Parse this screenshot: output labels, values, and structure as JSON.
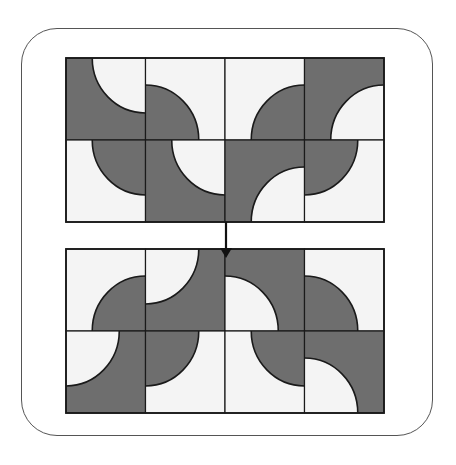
{
  "figure": {
    "colors": {
      "dark": "#6e6e6e",
      "light": "#f4f4f4",
      "line": "#1a1a1a",
      "frame": "#555555"
    },
    "radius_ratio": 0.67
  },
  "grids": [
    {
      "name": "top-grid",
      "x": 66,
      "y": 58,
      "w": 318,
      "h": 164,
      "tiles": [
        [
          {
            "base": "dark",
            "corner": "tr"
          },
          {
            "base": "light",
            "corner": "bl"
          },
          {
            "base": "light",
            "corner": "br"
          },
          {
            "base": "dark",
            "corner": "br"
          }
        ],
        [
          {
            "base": "light",
            "corner": "tr"
          },
          {
            "base": "dark",
            "corner": "tr"
          },
          {
            "base": "dark",
            "corner": "br"
          },
          {
            "base": "light",
            "corner": "tl"
          }
        ]
      ]
    },
    {
      "name": "bottom-grid",
      "x": 66,
      "y": 249,
      "w": 318,
      "h": 164,
      "tiles": [
        [
          {
            "base": "light",
            "corner": "br"
          },
          {
            "base": "dark",
            "corner": "tl"
          },
          {
            "base": "dark",
            "corner": "bl"
          },
          {
            "base": "light",
            "corner": "bl"
          }
        ],
        [
          {
            "base": "dark",
            "corner": "tl"
          },
          {
            "base": "light",
            "corner": "tl"
          },
          {
            "base": "light",
            "corner": "tr"
          },
          {
            "base": "dark",
            "corner": "bl"
          }
        ]
      ]
    }
  ],
  "arrow": {
    "x": 226,
    "y1": 222,
    "y2": 258,
    "direction": "down"
  }
}
